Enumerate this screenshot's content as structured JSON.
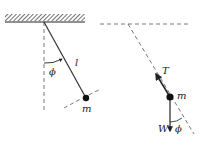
{
  "diagram": {
    "left_panel": {
      "labels": {
        "angle": "ϕ",
        "length": "l",
        "mass": "m"
      }
    },
    "right_panel": {
      "labels": {
        "tension": "T",
        "mass": "m",
        "weight": "W",
        "angle": "ϕ"
      }
    },
    "colors": {
      "ink": "#222222",
      "dashed": "#555555",
      "background": "#ffffff"
    }
  }
}
